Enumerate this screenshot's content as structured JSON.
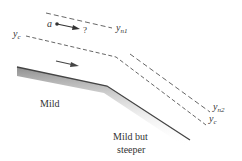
{
  "diagram": {
    "title": "",
    "labels": {
      "point": "a",
      "question": "?",
      "yn1_main": "y",
      "yn1_sub": "n1",
      "yc_left_main": "y",
      "yc_left_sub": "c",
      "yn2_main": "y",
      "yn2_sub": "n2",
      "yc_right_main": "y",
      "yc_right_sub": "c",
      "mild": "Mild",
      "steeper_line1": "Mild but",
      "steeper_line2": "steeper"
    },
    "colors": {
      "line": "#444444",
      "bed_shade": "#9a9a9a",
      "text": "#333333"
    }
  }
}
